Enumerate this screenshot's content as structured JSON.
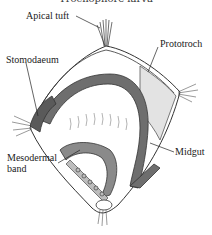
{
  "figure": {
    "title": "Trochophore larva",
    "labels": {
      "apical_tuft": "Apical tuft",
      "prototroch": "Prototroch",
      "stomodaeum": "Stomodaeum",
      "midgut": "Midgut",
      "mesodermal_band_line1": "Mesodermal",
      "mesodermal_band_line2": "band"
    }
  },
  "colors": {
    "outline": "#333333",
    "gut": "#6e6e6e",
    "gut_light": "#cfcfcf",
    "background": "#ffffff"
  }
}
